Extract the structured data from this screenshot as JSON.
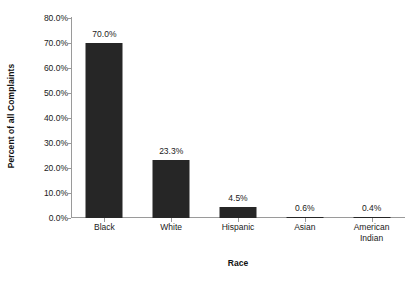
{
  "chart_data": {
    "type": "bar",
    "title": "",
    "xlabel": "Race",
    "ylabel": "Percent of all Complaints",
    "categories": [
      "Black",
      "White",
      "Hispanic",
      "Asian",
      "American Indian"
    ],
    "values": [
      70.0,
      23.3,
      4.5,
      0.6,
      0.4
    ],
    "data_labels": [
      "70.0%",
      "23.3%",
      "4.5%",
      "0.6%",
      "0.4%"
    ],
    "ylim": [
      0,
      80
    ],
    "ytick_values": [
      0,
      10,
      20,
      30,
      40,
      50,
      60,
      70,
      80
    ],
    "ytick_labels": [
      "0.0%",
      "10.0%",
      "20.0%",
      "30.0%",
      "40.0%",
      "50.0%",
      "60.0%",
      "70.0%",
      "80.0%"
    ],
    "grid": false,
    "legend": null,
    "bar_color": "#262626",
    "axis_color": "#9a9a9a",
    "background": "#ffffff"
  },
  "axes": {
    "y_title": "Percent of all Complaints",
    "x_title": "Race"
  },
  "categories": [
    {
      "label_line1": "Black",
      "label_line2": "",
      "value_label": "70.0%"
    },
    {
      "label_line1": "White",
      "label_line2": "",
      "value_label": "23.3%"
    },
    {
      "label_line1": "Hispanic",
      "label_line2": "",
      "value_label": "4.5%"
    },
    {
      "label_line1": "Asian",
      "label_line2": "",
      "value_label": "0.6%"
    },
    {
      "label_line1": "American",
      "label_line2": "Indian",
      "value_label": "0.4%"
    }
  ]
}
